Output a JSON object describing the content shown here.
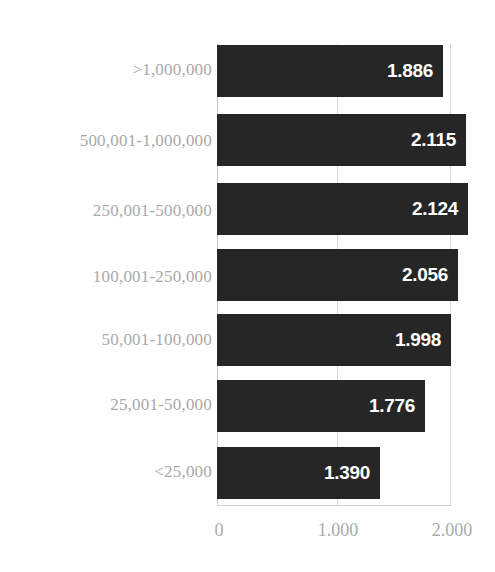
{
  "chart_data": {
    "type": "bar",
    "orientation": "horizontal",
    "title": "",
    "subtitle": "",
    "xlabel": "",
    "ylabel": "",
    "categories": [
      ">1,000,000",
      "500,001-1,000,000",
      "250,001-500,000",
      "100,001-250,000",
      "50,001-100,000",
      "25,001-50,000",
      "<25,000"
    ],
    "values": [
      1886,
      2115,
      2124,
      2056,
      1998,
      1776,
      1390
    ],
    "value_labels": [
      "1.886",
      "2.115",
      "2.124",
      "2.056",
      "1.998",
      "1.776",
      "1.390"
    ],
    "xlim": [
      0,
      2000
    ],
    "xticks": [
      0,
      1000,
      2000
    ],
    "xticklabels": [
      "0",
      "1.000",
      "2.000"
    ],
    "grid": true,
    "legend": "none",
    "number_format": "period thousands separator",
    "colors": {
      "bar": "#262626",
      "value_label": "#ffffff",
      "category_label": "#a9a9a9",
      "tick_label": "#a9a9a9",
      "gridline": "#d9d9d9",
      "background": "#ffffff"
    }
  }
}
